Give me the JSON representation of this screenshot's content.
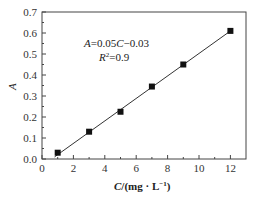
{
  "chart_data": {
    "type": "scatter",
    "title": "",
    "xlabel": "C/(mg · L⁻¹)",
    "ylabel": "A",
    "xlim": [
      0,
      13
    ],
    "ylim": [
      0,
      0.7
    ],
    "x_ticks": [
      "0",
      "2",
      "4",
      "6",
      "8",
      "10",
      "12"
    ],
    "y_ticks": [
      "0.0",
      "0.1",
      "0.2",
      "0.3",
      "0.4",
      "0.5",
      "0.6",
      "0.7"
    ],
    "grid": false,
    "legend": null,
    "series": [
      {
        "name": "data",
        "marker": "square",
        "x": [
          1,
          3,
          5,
          7,
          9,
          12
        ],
        "y": [
          0.03,
          0.13,
          0.225,
          0.345,
          0.45,
          0.61
        ]
      },
      {
        "name": "fit",
        "style": "line",
        "x": [
          0.8,
          12.1
        ],
        "y": [
          0.01,
          0.615
        ]
      }
    ],
    "annotations": {
      "equation": "A=0.05C−0.03",
      "r_squared": "R²=0.9"
    }
  },
  "labels": {
    "xlabel_var": "C",
    "xlabel_rest": "/(mg · L",
    "xlabel_sup": "−1",
    "xlabel_close": ")",
    "ylabel": "A",
    "eq_A": "A",
    "eq_mid": "=0.05",
    "eq_C": "C",
    "eq_end": "−0.03",
    "r2_R": "R",
    "r2_sup": "2",
    "r2_end": "=0.9"
  }
}
